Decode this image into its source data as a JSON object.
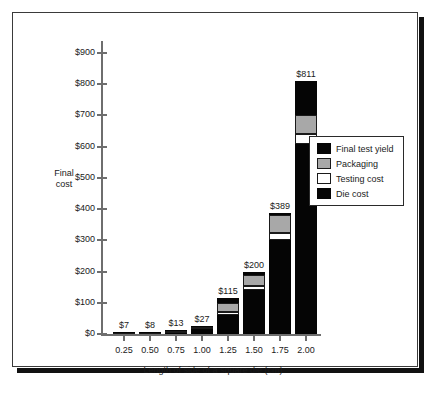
{
  "chart_data": {
    "type": "bar",
    "subtype": "stacked-bar",
    "title": "",
    "xlabel": "Length of side of a square die (cm)",
    "ylabel": "Final cost",
    "ylabel_lines": [
      "Final",
      "cost"
    ],
    "categories": [
      "0.25",
      "0.50",
      "0.75",
      "1.00",
      "1.25",
      "1.50",
      "1.75",
      "2.00"
    ],
    "ylim": [
      0,
      900
    ],
    "yticks": [
      0,
      100,
      200,
      300,
      400,
      500,
      600,
      700,
      800,
      900
    ],
    "ytick_labels": [
      "$0",
      "$100",
      "$200",
      "$300",
      "$400",
      "$500",
      "$600",
      "$700",
      "$800",
      "$900"
    ],
    "grid": false,
    "legend_position": "right",
    "series": [
      {
        "name": "Die cost",
        "color": "#050505",
        "values": [
          4,
          6,
          9,
          20,
          62,
          140,
          300,
          610
        ]
      },
      {
        "name": "Testing cost",
        "color": "#ffffff",
        "values": [
          1,
          1,
          2,
          3,
          8,
          14,
          22,
          30
        ]
      },
      {
        "name": "Packaging",
        "color": "#a8a8a8",
        "values": [
          1,
          1,
          1,
          2,
          30,
          34,
          60,
          62
        ]
      },
      {
        "name": "Final test yield",
        "color": "#050505",
        "values": [
          1,
          0,
          1,
          2,
          15,
          12,
          7,
          109
        ]
      }
    ],
    "stack_order_bottom_to_top": [
      "Die cost",
      "Testing cost",
      "Packaging",
      "Final test yield"
    ],
    "totals": [
      7,
      8,
      13,
      27,
      115,
      200,
      389,
      811
    ],
    "total_labels": [
      "$7",
      "$8",
      "$13",
      "$27",
      "$115",
      "$200",
      "$389",
      "$811"
    ],
    "annotations": [
      "$7",
      "$8",
      "$13",
      "$27",
      "$115",
      "$200",
      "$389",
      "$811"
    ]
  },
  "legend": {
    "items": [
      {
        "label": "Final test yield",
        "swatch": "black"
      },
      {
        "label": "Packaging",
        "swatch": "gray"
      },
      {
        "label": "Testing cost",
        "swatch": "white"
      },
      {
        "label": "Die cost",
        "swatch": "black"
      }
    ]
  }
}
